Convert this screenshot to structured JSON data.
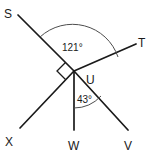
{
  "figure": {
    "type": "geometry-diagram",
    "background_color": "#ffffff",
    "line_color": "#1a1a1a",
    "arc_color": "#4d4d4d",
    "vertex": {
      "name": "U",
      "x": 74,
      "y": 71
    },
    "rays": [
      {
        "id": "ray-us",
        "endpoint_label": "S",
        "from_x": 74,
        "from_y": 71,
        "to_x": 18,
        "to_y": 15,
        "label_x": 10,
        "label_y": 14
      },
      {
        "id": "ray-ut",
        "endpoint_label": "T",
        "from_x": 74,
        "from_y": 71,
        "to_x": 136,
        "to_y": 44,
        "label_x": 140,
        "label_y": 43
      },
      {
        "id": "ray-ux",
        "endpoint_label": "X",
        "from_x": 74,
        "from_y": 71,
        "to_x": 20,
        "to_y": 128,
        "label_x": 6,
        "label_y": 144
      },
      {
        "id": "ray-uw",
        "endpoint_label": "W",
        "from_x": 74,
        "from_y": 71,
        "to_x": 74,
        "to_y": 130,
        "label_x": 69,
        "label_y": 146
      },
      {
        "id": "ray-uv",
        "endpoint_label": "V",
        "from_x": 74,
        "from_y": 71,
        "to_x": 128,
        "to_y": 130,
        "label_x": 128,
        "label_y": 146
      }
    ],
    "vertex_label": {
      "text": "U",
      "x": 88,
      "y": 82
    },
    "angles": [
      {
        "id": "angle-sut",
        "value": "121°",
        "between": [
          "S",
          "T"
        ],
        "label_x": 64,
        "label_y": 49,
        "arc_path": "M 42 39 A 45 45 0 0 1 117 56"
      },
      {
        "id": "angle-wuv",
        "value": "43°",
        "between": [
          "W",
          "V"
        ],
        "label_x": 78,
        "label_y": 101,
        "arc_path": "M 74 107 A 36 36 0 0 0 100 96"
      }
    ],
    "right_angle": {
      "id": "right-angle-sux",
      "between": [
        "S",
        "X"
      ],
      "marker_path": "M 64 61 L 55 70 L 64 79"
    }
  }
}
